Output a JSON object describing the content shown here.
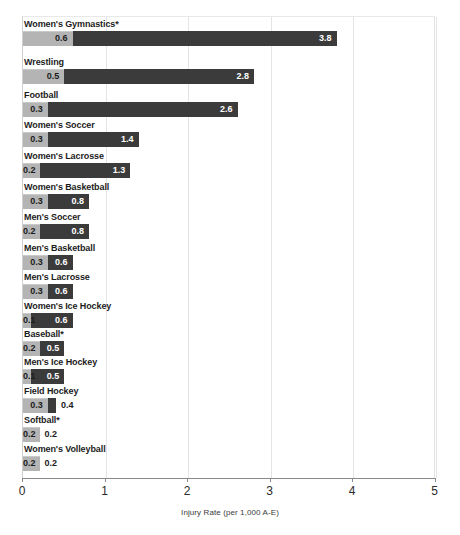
{
  "chart_data": {
    "type": "bar",
    "orientation": "horizontal",
    "title": "",
    "xlabel": "Injury Rate (per 1,000 A-E)",
    "ylabel": "",
    "xlim": [
      0,
      5
    ],
    "xticks": [
      0,
      1,
      2,
      3,
      4,
      5
    ],
    "xtick_labels": [
      "0",
      "1",
      "2",
      "3",
      "4",
      "5"
    ],
    "grid": true,
    "legend": "none",
    "categories": [
      "Women's Gymnastics*",
      "Wrestling",
      "Football",
      "Women's Soccer",
      "Women's Lacrosse",
      "Women's Basketball",
      "Men's Soccer",
      "Men's Basketball",
      "Men's Lacrosse",
      "Women's Ice Hockey",
      "Baseball*",
      "Men's Ice Hockey",
      "Field Hockey",
      "Softball*",
      "Women's Volleyball"
    ],
    "series": [
      {
        "name": "dark",
        "color": "#3b3b3b",
        "values": [
          3.8,
          2.8,
          2.6,
          1.4,
          1.3,
          0.8,
          0.8,
          0.6,
          0.6,
          0.6,
          0.5,
          0.5,
          0.4,
          0.2,
          0.2
        ]
      },
      {
        "name": "light",
        "color": "#b4b4b4",
        "values": [
          0.6,
          0.5,
          0.3,
          0.3,
          0.2,
          0.3,
          0.2,
          0.3,
          0.3,
          0.1,
          0.2,
          0.1,
          0.3,
          0.2,
          0.2
        ]
      }
    ],
    "rows": [
      {
        "label": "Women's Gymnastics*",
        "dark": "3.8",
        "light": "0.6",
        "dark_value": 3.8,
        "light_value": 0.6,
        "dark_label_outside": false
      },
      {
        "label": "Wrestling",
        "dark": "2.8",
        "light": "0.5",
        "dark_value": 2.8,
        "light_value": 0.5,
        "dark_label_outside": false
      },
      {
        "label": "Football",
        "dark": "2.6",
        "light": "0.3",
        "dark_value": 2.6,
        "light_value": 0.3,
        "dark_label_outside": false
      },
      {
        "label": "Women's Soccer",
        "dark": "1.4",
        "light": "0.3",
        "dark_value": 1.4,
        "light_value": 0.3,
        "dark_label_outside": false
      },
      {
        "label": "Women's Lacrosse",
        "dark": "1.3",
        "light": "0.2",
        "dark_value": 1.3,
        "light_value": 0.2,
        "dark_label_outside": false
      },
      {
        "label": "Women's Basketball",
        "dark": "0.8",
        "light": "0.3",
        "dark_value": 0.8,
        "light_value": 0.3,
        "dark_label_outside": false
      },
      {
        "label": "Men's Soccer",
        "dark": "0.8",
        "light": "0.2",
        "dark_value": 0.8,
        "light_value": 0.2,
        "dark_label_outside": false
      },
      {
        "label": "Men's Basketball",
        "dark": "0.6",
        "light": "0.3",
        "dark_value": 0.6,
        "light_value": 0.3,
        "dark_label_outside": false
      },
      {
        "label": "Men's Lacrosse",
        "dark": "0.6",
        "light": "0.3",
        "dark_value": 0.6,
        "light_value": 0.3,
        "dark_label_outside": false
      },
      {
        "label": "Women's Ice Hockey",
        "dark": "0.6",
        "light": "0.1",
        "dark_value": 0.6,
        "light_value": 0.1,
        "dark_label_outside": false
      },
      {
        "label": "Baseball*",
        "dark": "0.5",
        "light": "0.2",
        "dark_value": 0.5,
        "light_value": 0.2,
        "dark_label_outside": false
      },
      {
        "label": "Men's Ice Hockey",
        "dark": "0.5",
        "light": "0.1",
        "dark_value": 0.5,
        "light_value": 0.1,
        "dark_label_outside": false
      },
      {
        "label": "Field Hockey",
        "dark": "0.4",
        "light": "0.3",
        "dark_value": 0.4,
        "light_value": 0.3,
        "dark_label_outside": true
      },
      {
        "label": "Softball*",
        "dark": "0.2",
        "light": "0.2",
        "dark_value": 0.2,
        "light_value": 0.2,
        "dark_label_outside": true
      },
      {
        "label": "Women's Volleyball",
        "dark": "0.2",
        "light": "0.2",
        "dark_value": 0.2,
        "light_value": 0.2,
        "dark_label_outside": true
      }
    ]
  },
  "layout": {
    "x0_px": 22,
    "px_per_unit": 82.5,
    "row_tops": [
      18,
      56,
      89,
      119,
      150,
      181,
      211,
      242,
      271,
      300,
      328,
      356,
      385,
      414,
      443
    ],
    "bar_offset": 12
  }
}
